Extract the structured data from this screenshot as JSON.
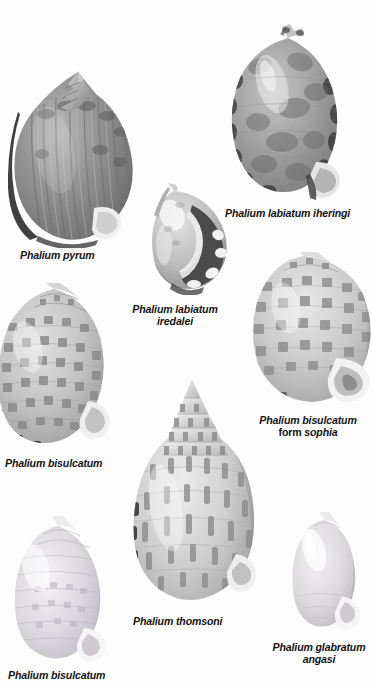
{
  "plate": {
    "title": "Phalium species plate",
    "background_color": "#fdfdfd",
    "text_color": "#141414",
    "width": 372,
    "height": 686
  },
  "specimens": [
    {
      "id": "phalium-pyrum",
      "label": "Phalium pyrum",
      "label_lines": [
        "Phalium pyrum"
      ],
      "position": {
        "left": 8,
        "top": 58,
        "width": 132,
        "height": 190
      },
      "label_position": {
        "left": 20,
        "top": 249
      },
      "shell_tone": "#8d8d8d",
      "pattern": "ribbed-grey"
    },
    {
      "id": "phalium-labiatum-iheringi",
      "label": "Phalium labiatum iheringi",
      "label_lines": [
        "Phalium labiatum iheringi"
      ],
      "position": {
        "left": 224,
        "top": 22,
        "width": 126,
        "height": 186
      },
      "label_position": {
        "left": 225,
        "top": 207
      },
      "shell_tone": "#9a9a9a",
      "pattern": "mottled-blotch"
    },
    {
      "id": "phalium-labiatum-iredalei",
      "label": "Phalium labiatum iredalei",
      "label_lines": [
        "Phalium labiatum",
        "iredalei"
      ],
      "position": {
        "left": 146,
        "top": 183,
        "width": 88,
        "height": 112
      },
      "label_position": {
        "left": 113,
        "top": 303,
        "width": 124
      },
      "shell_tone": "#b3b3b3",
      "pattern": "banded-dark"
    },
    {
      "id": "phalium-bisulcatum-left",
      "label": "Phalium bisulcatum",
      "label_lines": [
        "Phalium bisulcatum"
      ],
      "position": {
        "left": -8,
        "top": 283,
        "width": 126,
        "height": 172
      },
      "label_position": {
        "left": 5,
        "top": 457
      },
      "shell_tone": "#bdbdbd",
      "pattern": "checkered"
    },
    {
      "id": "phalium-bisulcatum-form-sophia",
      "label": "Phalium bisulcatum form sophia",
      "label_lines": [
        "Phalium bisulcatum",
        "form sophia"
      ],
      "label_line1": "Phalium bisulcatum",
      "label_line2_roman": "form ",
      "label_line2_italic": "sophia",
      "position": {
        "left": 244,
        "top": 252,
        "width": 132,
        "height": 160
      },
      "label_position": {
        "left": 243,
        "top": 414,
        "width": 130
      },
      "shell_tone": "#c4c4c4",
      "pattern": "checkered"
    },
    {
      "id": "phalium-thomsoni",
      "label": "Phalium thomsoni",
      "label_lines": [
        "Phalium thomsoni"
      ],
      "position": {
        "left": 128,
        "top": 376,
        "width": 134,
        "height": 232
      },
      "label_position": {
        "left": 133,
        "top": 615
      },
      "shell_tone": "#c9c9c9",
      "pattern": "axial-dashes"
    },
    {
      "id": "phalium-bisulcatum-bottom",
      "label": "Phalium bisulcatum",
      "label_lines": [
        "Phalium bisulcatum"
      ],
      "position": {
        "left": 8,
        "top": 516,
        "width": 104,
        "height": 152
      },
      "label_position": {
        "left": 8,
        "top": 669
      },
      "shell_tone": "#d5d3d6",
      "pattern": "faint-spiral"
    },
    {
      "id": "phalium-glabratum-angasi",
      "label": "Phalium glabratum angasi",
      "label_lines": [
        "Phalium glabratum",
        "angasi"
      ],
      "position": {
        "left": 290,
        "top": 512,
        "width": 74,
        "height": 122
      },
      "label_position": {
        "left": 268,
        "top": 641,
        "width": 102
      },
      "shell_tone": "#d8d6d8",
      "pattern": "smooth-glossy"
    }
  ]
}
